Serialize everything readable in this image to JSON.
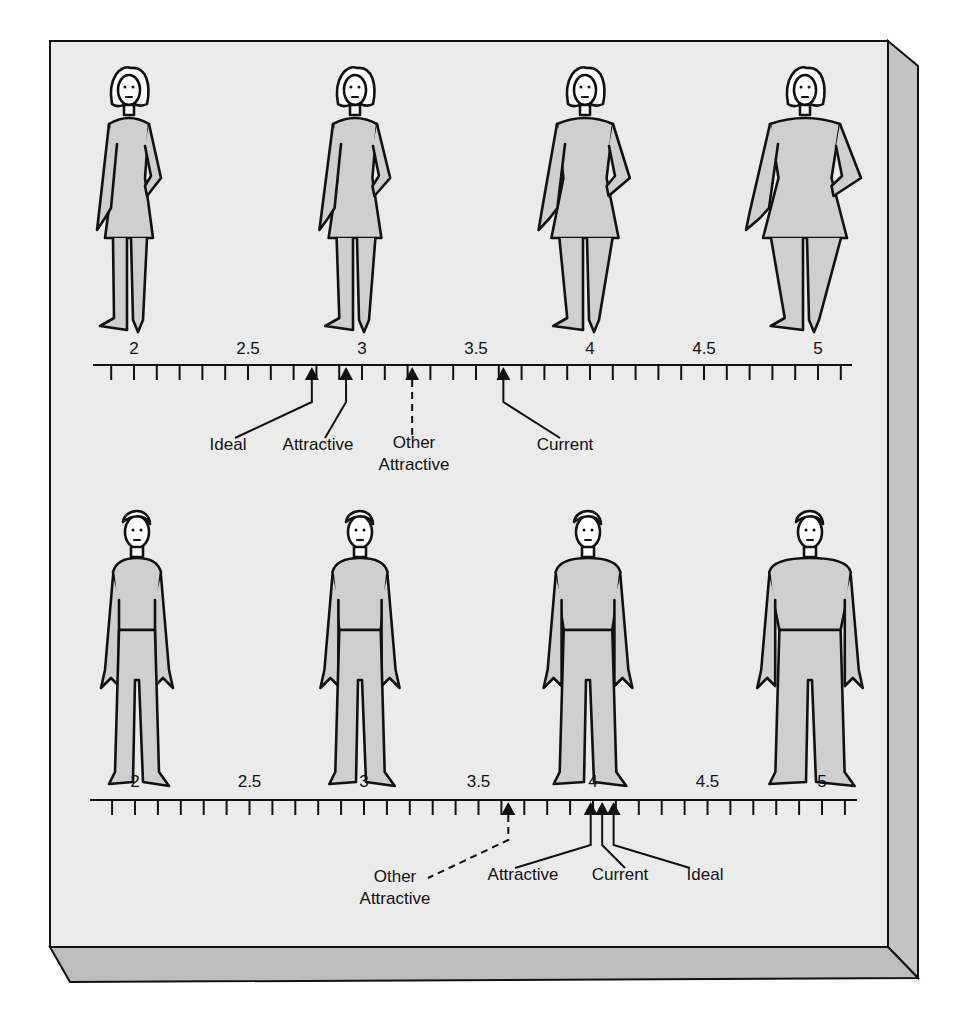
{
  "chart_data": {
    "type": "diagram",
    "title": "",
    "scales": [
      {
        "group": "women",
        "figures": [
          "slim",
          "average-slim",
          "average-heavy",
          "heavy"
        ],
        "tick_labels": [
          "2",
          "2.5",
          "3",
          "3.5",
          "4",
          "4.5",
          "5"
        ],
        "range": [
          1.9,
          5.1
        ],
        "tick_step": 0.1,
        "markers": [
          {
            "label": "Ideal",
            "value": 2.78,
            "style": "solid"
          },
          {
            "label": "Attractive",
            "value": 2.93,
            "style": "solid"
          },
          {
            "label": "Other Attractive",
            "value": 3.22,
            "style": "dashed"
          },
          {
            "label": "Current",
            "value": 3.62,
            "style": "solid"
          }
        ]
      },
      {
        "group": "men",
        "figures": [
          "slim",
          "average-slim",
          "average-heavy",
          "heavy"
        ],
        "tick_labels": [
          "2",
          "2.5",
          "3",
          "3.5",
          "4",
          "4.5",
          "5"
        ],
        "range": [
          1.9,
          5.1
        ],
        "tick_step": 0.1,
        "markers": [
          {
            "label": "Other Attractive",
            "value": 3.63,
            "style": "dashed"
          },
          {
            "label": "Attractive",
            "value": 3.99,
            "style": "solid"
          },
          {
            "label": "Current",
            "value": 4.04,
            "style": "solid"
          },
          {
            "label": "Ideal",
            "value": 4.09,
            "style": "solid"
          }
        ]
      }
    ]
  },
  "colors": {
    "panel": "#ebebeb",
    "side": "#c4c4c4",
    "bottom": "#bdbdbd",
    "figure_fill": "#cfcfcf",
    "ink": "#111111"
  }
}
